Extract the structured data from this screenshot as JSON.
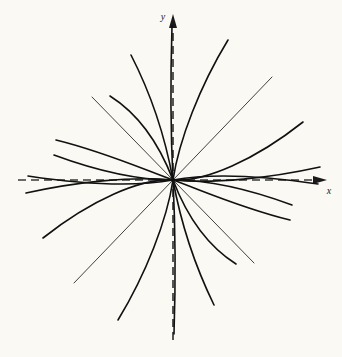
{
  "figure": {
    "type": "phase-portrait",
    "background_color": "#faf9f4",
    "curve_color": "#111111",
    "axis_color": "#3a3a3a",
    "width": 342,
    "height": 357
  },
  "axes": {
    "x_axis": {
      "label": "x",
      "style": "dashed",
      "orientation": "horizontal",
      "arrow": "right",
      "y_position": 180,
      "start_x": 18,
      "end_x": 327
    },
    "y_axis": {
      "label": "y",
      "style": "dashed",
      "orientation": "vertical",
      "arrow": "up",
      "x_position": 173,
      "start_y": 340,
      "end_y": 14
    },
    "origin": {
      "x": 173,
      "y": 180
    }
  },
  "chart_data": {
    "type": "line",
    "title": "",
    "xlabel": "x",
    "ylabel": "y",
    "grid": false,
    "legend": false,
    "origin": {
      "x": 0,
      "y": 0
    },
    "axis_style": "dashed",
    "series": [
      {
        "name": "steep-curve-UL-1",
        "quadrant": "upper-left",
        "width": 1.6,
        "path": "M 173,180 C 171,140 170,90 172,26"
      },
      {
        "name": "steep-curve-UL-2",
        "quadrant": "upper-left",
        "width": 1.6,
        "path": "M 173,180 C 165,136 150,92 131,55"
      },
      {
        "name": "steep-curve-UL-3",
        "quadrant": "upper-left",
        "width": 1.6,
        "path": "M 173,180 C 160,146 140,115 110,96"
      },
      {
        "name": "line-UL-diagonal",
        "quadrant": "upper-left",
        "width": 0.8,
        "path": "M 173,180 L 92,97"
      },
      {
        "name": "flat-curve-UL-1",
        "quadrant": "upper-left",
        "width": 1.6,
        "path": "M 173,180 C 145,170 105,152 56,140"
      },
      {
        "name": "flat-curve-UL-2",
        "quadrant": "upper-left",
        "width": 1.6,
        "path": "M 173,180 C 142,180 100,172 54,155"
      },
      {
        "name": "flat-curve-UL-3",
        "quadrant": "upper-left",
        "width": 1.6,
        "path": "M 173,180 C 140,186 95,186 28,176"
      },
      {
        "name": "steep-curve-UR-1",
        "quadrant": "upper-right",
        "width": 1.6,
        "path": "M 173,180 C 179,140 200,86 228,40"
      },
      {
        "name": "line-UR-diagonal",
        "quadrant": "upper-right",
        "width": 0.8,
        "path": "M 173,180 L 272,77"
      },
      {
        "name": "flat-curve-UR-1",
        "quadrant": "upper-right",
        "width": 1.6,
        "path": "M 173,180 C 205,182 255,160 303,122"
      },
      {
        "name": "flat-curve-UR-2",
        "quadrant": "upper-right",
        "width": 1.6,
        "path": "M 173,180 C 215,184 270,178 320,167"
      },
      {
        "name": "steep-curve-LR-1",
        "quadrant": "lower-right",
        "width": 1.6,
        "path": "M 173,180 C 175,220 176,272 174,334"
      },
      {
        "name": "steep-curve-LR-2",
        "quadrant": "lower-right",
        "width": 1.6,
        "path": "M 173,180 C 181,224 196,268 214,305"
      },
      {
        "name": "steep-curve-LR-3",
        "quadrant": "lower-right",
        "width": 1.6,
        "path": "M 173,180 C 186,214 206,245 236,264"
      },
      {
        "name": "line-LR-diagonal",
        "quadrant": "lower-right",
        "width": 0.8,
        "path": "M 173,180 L 254,263"
      },
      {
        "name": "flat-curve-LR-1",
        "quadrant": "lower-right",
        "width": 1.6,
        "path": "M 173,180 C 201,190 241,208 290,220"
      },
      {
        "name": "flat-curve-LR-2",
        "quadrant": "lower-right",
        "width": 1.6,
        "path": "M 173,180 C 204,180 246,188 292,205"
      },
      {
        "name": "flat-curve-LR-3",
        "quadrant": "lower-right",
        "width": 1.6,
        "path": "M 173,180 C 206,174 251,174 318,184"
      },
      {
        "name": "steep-curve-LL-1",
        "quadrant": "lower-left",
        "width": 1.6,
        "path": "M 173,180 C 167,220 146,274 118,320"
      },
      {
        "name": "line-LL-diagonal",
        "quadrant": "lower-left",
        "width": 0.8,
        "path": "M 173,180 L 74,283"
      },
      {
        "name": "flat-curve-LL-1",
        "quadrant": "lower-left",
        "width": 1.6,
        "path": "M 173,180 C 141,178 91,200 43,238"
      },
      {
        "name": "flat-curve-LL-2",
        "quadrant": "lower-left",
        "width": 1.6,
        "path": "M 173,180 C 131,176 76,182 26,193"
      }
    ]
  }
}
